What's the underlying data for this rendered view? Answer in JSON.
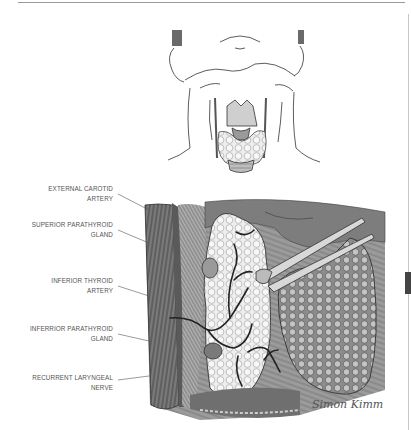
{
  "figure": {
    "type": "medical-illustration",
    "inset_view": "Anterior neck showing thyroid gland",
    "main_view": "Exposed thyroid lobe with parathyroid glands, forceps retracting"
  },
  "labels": [
    {
      "line1": "EXTERNAL CAROTID",
      "line2": "ARTERY"
    },
    {
      "line1": "SUPERIOR PARATHYROID",
      "line2": "GLAND"
    },
    {
      "line1": "INFERIOR THYROID",
      "line2": "ARTERY"
    },
    {
      "line1": "INFERRIOR PARATHYROID",
      "line2": "GLAND"
    },
    {
      "line1": "RECURRENT LARYNGEAL",
      "line2": "NERVE"
    }
  ],
  "signature": "Simon Kimm"
}
